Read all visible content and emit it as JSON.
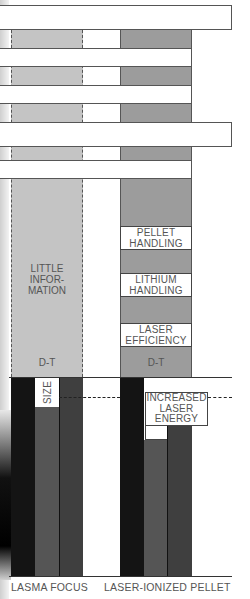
{
  "diagram": {
    "columns": [
      {
        "id": "plasma-focus",
        "caption": "LASMA FOCUS",
        "upper_label": "LITTLE\nINFOR-\nMATION",
        "upper_label_lines": [
          "LITTLE",
          "INFOR-",
          "MATION"
        ],
        "fuel_label": "D-T",
        "lower_annotation": "SIZE"
      },
      {
        "id": "laser-ionized-pellet",
        "caption": "LASER-IONIZED PELLET",
        "issues": [
          {
            "lines": [
              "PELLET",
              "HANDLING"
            ]
          },
          {
            "lines": [
              "LITHIUM",
              "HANDLING"
            ]
          },
          {
            "lines": [
              "LASER",
              "EFFICIENCY"
            ]
          }
        ],
        "fuel_label": "D-T",
        "lower_annotation_lines": [
          "INCREASED",
          "LASER",
          "ENERGY"
        ]
      }
    ],
    "colors": {
      "light_fill": "#c4c4c4",
      "mid_fill": "#9c9c9c",
      "black_bar": "#141414",
      "gray_bar": "#555555",
      "dark_bar": "#3f3f3f",
      "text": "#555555"
    }
  }
}
